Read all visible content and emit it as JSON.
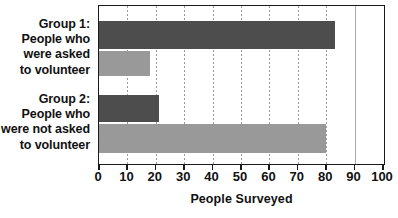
{
  "chart_data": {
    "type": "bar",
    "orientation": "horizontal",
    "title": "",
    "xlabel": "People Surveyed",
    "ylabel": "",
    "xlim": [
      0,
      100
    ],
    "xticks": [
      0,
      10,
      20,
      30,
      40,
      50,
      60,
      70,
      80,
      90,
      100
    ],
    "xticklabels": [
      "0",
      "10",
      "20",
      "30",
      "40",
      "50",
      "60",
      "70",
      "80",
      "90",
      "100"
    ],
    "grid": true,
    "grid_axis": "x",
    "legend": false,
    "categories": [
      "Group 1: People who were asked to volunteer",
      "Group 2: People who were not asked to volunteer"
    ],
    "category_lines": [
      [
        "Group 1:",
        "People who",
        "were asked",
        "to volunteer"
      ],
      [
        "Group 2:",
        "People who",
        "were not asked",
        "to volunteer"
      ]
    ],
    "series": [
      {
        "name": "dark",
        "color": "#4d4d4d",
        "values": [
          83,
          21
        ]
      },
      {
        "name": "light",
        "color": "#999999",
        "values": [
          18,
          80
        ]
      }
    ],
    "bars": [
      {
        "group": "Group 1",
        "series": "dark",
        "value": 83
      },
      {
        "group": "Group 1",
        "series": "light",
        "value": 18
      },
      {
        "group": "Group 2",
        "series": "dark",
        "value": 21
      },
      {
        "group": "Group 2",
        "series": "light",
        "value": 80
      }
    ]
  },
  "colors": {
    "dark_bar": "#4d4d4d",
    "light_bar": "#999999",
    "frame": "#1a1a1a",
    "gridline": "#9a9a9a",
    "text": "#111111",
    "background": "#ffffff"
  },
  "labels": {
    "group1": {
      "l0": "Group 1:",
      "l1": "People who",
      "l2": "were asked",
      "l3": "to volunteer"
    },
    "group2": {
      "l0": "Group 2:",
      "l1": "People who",
      "l2": "were not asked",
      "l3": "to volunteer"
    }
  },
  "axis": {
    "title": "People Surveyed"
  }
}
